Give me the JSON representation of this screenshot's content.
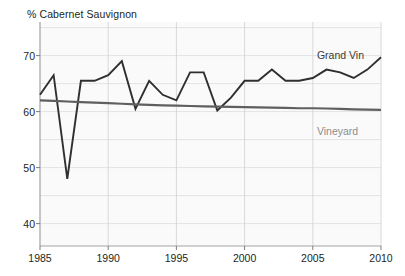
{
  "chart_data": {
    "type": "line",
    "title": "% Cabernet Sauvignon",
    "title_prefix": "%",
    "title_text": "Cabernet Sauvignon",
    "xlabel": "",
    "ylabel": "",
    "xlim": [
      1985,
      2010
    ],
    "ylim": [
      36,
      76
    ],
    "grid": true,
    "grid_y_step": 5,
    "grid_x_step": 5,
    "legend_position": "inline-right",
    "x": [
      1985,
      1986,
      1987,
      1988,
      1989,
      1990,
      1991,
      1992,
      1993,
      1994,
      1995,
      1996,
      1997,
      1998,
      1999,
      2000,
      2001,
      2002,
      2003,
      2004,
      2005,
      2006,
      2007,
      2008,
      2009,
      2010
    ],
    "yticks": [
      40,
      50,
      60,
      70
    ],
    "xticks": [
      1985,
      1990,
      1995,
      2000,
      2005,
      2010
    ],
    "series": [
      {
        "name": "Grand Vin",
        "color": "#2f2f2f",
        "values": [
          63.0,
          66.5,
          48.0,
          65.5,
          65.5,
          66.5,
          69.0,
          60.5,
          65.5,
          63.0,
          62.0,
          67.0,
          67.0,
          60.2,
          62.5,
          65.5,
          65.5,
          67.5,
          65.5,
          65.5,
          66.0,
          67.5,
          67.0,
          66.0,
          67.5,
          69.7
        ]
      },
      {
        "name": "Vineyard",
        "color": "#5f5f5f",
        "values": [
          62.0,
          61.9,
          61.8,
          61.7,
          61.6,
          61.5,
          61.4,
          61.3,
          61.2,
          61.1,
          61.05,
          61.0,
          60.95,
          60.9,
          60.85,
          60.8,
          60.75,
          60.7,
          60.65,
          60.6,
          60.6,
          60.55,
          60.5,
          60.4,
          60.35,
          60.3
        ]
      }
    ],
    "annotations": [
      {
        "text": "Grand Vin",
        "x": 2005.3,
        "y": 71.2
      },
      {
        "text": "Vineyard",
        "x": 2005.3,
        "y": 57.6
      }
    ]
  }
}
